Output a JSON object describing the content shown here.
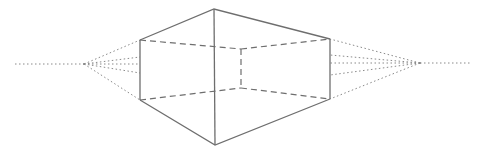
{
  "diagram": {
    "title": "",
    "type": "two-point-perspective-box",
    "colors": {
      "background": "#ffffff",
      "line": "#6e6e6e",
      "guide": "#8a8a8a"
    },
    "vanishing_points": {
      "left": [
        84,
        64
      ],
      "right": [
        420,
        63
      ]
    },
    "horizon": {
      "left": [
        [
          15,
          64
        ],
        [
          84,
          64
        ]
      ],
      "right": [
        [
          420,
          63
        ],
        [
          470,
          63
        ]
      ]
    },
    "front_edge": {
      "top": [
        214,
        9
      ],
      "bottom": [
        215,
        145
      ]
    },
    "left_edge": {
      "top": [
        140,
        40
      ],
      "bottom": [
        140,
        100
      ]
    },
    "right_edge": {
      "top": [
        330,
        39
      ],
      "bottom": [
        330,
        99
      ]
    },
    "back_edge": {
      "top": [
        241,
        49
      ],
      "bottom": [
        241,
        88
      ]
    }
  }
}
